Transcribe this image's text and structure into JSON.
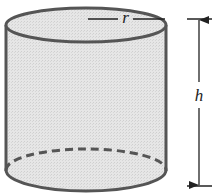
{
  "diagram": {
    "shape": "cylinder",
    "labels": {
      "radius": "r",
      "height": "h"
    },
    "colors": {
      "fill": "#e4e4e4",
      "stroke": "#555555",
      "dimension": "#222222",
      "background": "#ffffff"
    },
    "features": {
      "hidden_edge_dashed": true,
      "radius_line": true,
      "height_dimension_with_arrows": true
    }
  }
}
